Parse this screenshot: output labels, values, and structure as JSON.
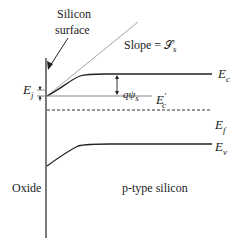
{
  "diagram": {
    "type": "energy-band-diagram",
    "labels": {
      "silicon_surface_line1": "Silicon",
      "silicon_surface_line2": "surface",
      "slope": "Slope = 𝒮",
      "slope_sub": "s",
      "ej": "E",
      "ej_sub": "j",
      "qpsi": "qψ",
      "qpsi_sub": "s",
      "ec": "E",
      "ec_sub": "c",
      "ec_prime": "E",
      "ec_prime_sub": "c",
      "ec_prime_mark": "′",
      "ef": "E",
      "ef_sub": "f",
      "ev": "E",
      "ev_sub": "v",
      "oxide": "Oxide",
      "region": "p-type silicon"
    },
    "colors": {
      "line": "#222222",
      "slope_line": "#888888",
      "gray_line": "#555555"
    }
  }
}
